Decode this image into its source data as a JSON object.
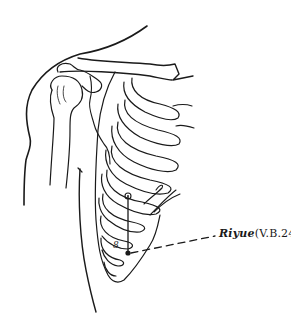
{
  "diagram": {
    "point": {
      "name": "Riyue",
      "code": "(V.B.24)",
      "marker_x": 128,
      "marker_y": 196
    },
    "rib_label": "8",
    "colors": {
      "line": "#1a1a1a",
      "background": "#ffffff"
    }
  }
}
